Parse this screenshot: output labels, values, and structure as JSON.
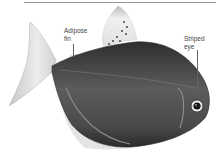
{
  "figure": {
    "colors": {
      "background": "#ffffff",
      "rule": "#9a9a9a",
      "label_text": "#444444",
      "leader_line": "#666666",
      "body_dark": "#3a3a3a",
      "body_mid": "#6b6b6b",
      "fin_light": "#e6e6e6"
    },
    "labels": [
      {
        "id": "adipose-fin",
        "text": "Adipose\nfin"
      },
      {
        "id": "striped-eye",
        "text": "Striped\neye"
      }
    ]
  }
}
